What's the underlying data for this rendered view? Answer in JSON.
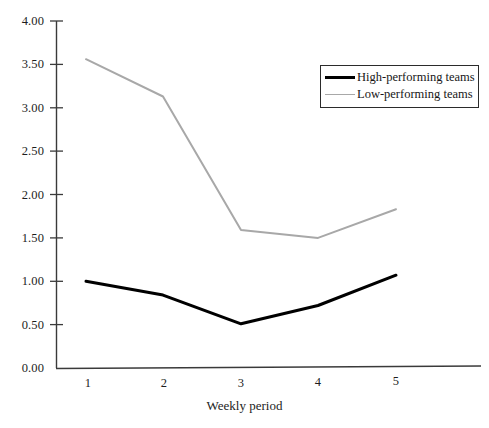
{
  "chart_data": {
    "type": "line",
    "title": "",
    "subtitle": "",
    "xlabel": "Weekly period",
    "ylabel": "",
    "x": [
      1,
      2,
      3,
      4,
      5
    ],
    "categories": [
      "1",
      "2",
      "3",
      "4",
      "5"
    ],
    "series": [
      {
        "name": "High-performing teams",
        "color": "#000000",
        "values": [
          1.0,
          0.84,
          0.51,
          0.72,
          1.07
        ]
      },
      {
        "name": "Low-performing teams",
        "color": "#a8a8a8",
        "values": [
          3.56,
          3.13,
          1.59,
          1.5,
          1.83
        ]
      }
    ],
    "ylim": [
      0.0,
      4.0
    ],
    "ytick_step": 0.5,
    "ytick_labels": [
      "4.00",
      "3.50",
      "3.00",
      "2.50",
      "2.00",
      "1.50",
      "1.00",
      "0.50",
      "0.00"
    ],
    "ytick_values": [
      4.0,
      3.5,
      3.0,
      2.5,
      2.0,
      1.5,
      1.0,
      0.5,
      0.0
    ],
    "xtick_labels": [
      "1",
      "2",
      "3",
      "4",
      "5"
    ],
    "grid": false,
    "legend_position": "top-right",
    "legend_entries": [
      "High-performing teams",
      "Low-performing teams"
    ]
  }
}
